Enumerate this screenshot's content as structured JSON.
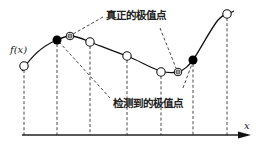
{
  "diagram": {
    "function_label": "f(x)",
    "axis_label": "x",
    "annotations": {
      "true_extremum": "真正的极值点",
      "detected_extremum": "检测到的极值点"
    },
    "colors": {
      "stroke": "#222222",
      "background": "#ffffff"
    },
    "curve_points": [
      [
        22,
        70
      ],
      [
        40,
        52
      ],
      [
        57,
        40
      ],
      [
        70,
        36
      ],
      [
        90,
        42
      ],
      [
        127,
        56
      ],
      [
        161,
        72
      ],
      [
        178,
        72
      ],
      [
        193,
        60
      ],
      [
        205,
        40
      ],
      [
        227,
        14
      ],
      [
        234,
        11
      ]
    ],
    "sample_points": [
      {
        "x": 24,
        "y": 66,
        "type": "sample"
      },
      {
        "x": 57,
        "y": 40,
        "type": "detected-extremum"
      },
      {
        "x": 90,
        "y": 42,
        "type": "sample"
      },
      {
        "x": 127,
        "y": 56,
        "type": "sample"
      },
      {
        "x": 161,
        "y": 72,
        "type": "sample"
      },
      {
        "x": 193,
        "y": 60,
        "type": "detected-extremum"
      },
      {
        "x": 227,
        "y": 14,
        "type": "sample"
      }
    ],
    "true_extrema": [
      {
        "x": 70,
        "y": 36
      },
      {
        "x": 178,
        "y": 72
      }
    ]
  }
}
